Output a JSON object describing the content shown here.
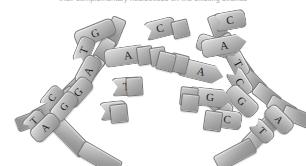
{
  "figure": {
    "caption_fragment": "their complementary nucleotides on the existing strands",
    "background_color": "#ffffff",
    "piece_fill_light": "#e2e2e2",
    "piece_fill_dark": "#8c8c8c",
    "outline_color": "#7a7a7a",
    "letter_color": "#1b1b1b"
  },
  "left_strand": {
    "label": "left-template-strand",
    "backbone_segments": 9,
    "bases": [
      {
        "letter": "G",
        "x": 74,
        "y": 24,
        "rot": -22,
        "w": 40,
        "h": 16,
        "fs": 11
      },
      {
        "letter": "T",
        "x": 70,
        "y": 42,
        "rot": -68,
        "w": 26,
        "h": 15,
        "fs": 11
      },
      {
        "letter": "A",
        "x": 72,
        "y": 62,
        "rot": -62,
        "w": 30,
        "h": 16,
        "fs": 11
      },
      {
        "letter": "G",
        "x": 62,
        "y": 83,
        "rot": -48,
        "w": 30,
        "h": 16,
        "fs": 11
      },
      {
        "letter": "C",
        "x": 39,
        "y": 90,
        "rot": -50,
        "w": 24,
        "h": 14,
        "fs": 10
      },
      {
        "letter": "G",
        "x": 48,
        "y": 98,
        "rot": -50,
        "w": 30,
        "h": 15,
        "fs": 10
      },
      {
        "letter": "T",
        "x": 22,
        "y": 113,
        "rot": -44,
        "w": 22,
        "h": 14,
        "fs": 10
      },
      {
        "letter": "A",
        "x": 29,
        "y": 119,
        "rot": -44,
        "w": 30,
        "h": 15,
        "fs": 10
      }
    ]
  },
  "right_strand": {
    "label": "right-template-strand",
    "backbone_segments": 9,
    "bases": [
      {
        "letter": "A",
        "x": 196,
        "y": 38,
        "rot": 17,
        "w": 42,
        "h": 16,
        "fs": 11
      },
      {
        "letter": "T",
        "x": 224,
        "y": 55,
        "rot": 62,
        "w": 26,
        "h": 15,
        "fs": 11
      },
      {
        "letter": "C",
        "x": 225,
        "y": 73,
        "rot": 58,
        "w": 28,
        "h": 16,
        "fs": 11
      },
      {
        "letter": "G",
        "x": 224,
        "y": 92,
        "rot": 44,
        "w": 34,
        "h": 16,
        "fs": 11
      },
      {
        "letter": "G",
        "x": 204,
        "y": 96,
        "rot": 42,
        "w": 28,
        "h": 15,
        "fs": 11
      },
      {
        "letter": "A",
        "x": 263,
        "y": 111,
        "rot": 46,
        "w": 30,
        "h": 15,
        "fs": 10
      },
      {
        "letter": "T",
        "x": 249,
        "y": 123,
        "rot": 46,
        "w": 24,
        "h": 14,
        "fs": 10
      }
    ]
  },
  "free_nucleotides": [
    {
      "letter": "C",
      "x": 144,
      "y": 19,
      "rot": -14,
      "w": 30,
      "h": 17,
      "fs": 11,
      "shape": "tail",
      "group": "centre-left"
    },
    {
      "letter": "A",
      "x": 104,
      "y": 46,
      "rot": -8,
      "w": 46,
      "h": 17,
      "fs": 11,
      "shape": "point",
      "group": "centre-left"
    },
    {
      "letter": "T",
      "x": 111,
      "y": 77,
      "rot": -4,
      "w": 28,
      "h": 17,
      "fs": 11,
      "shape": "tail",
      "group": "centre-left"
    },
    {
      "letter": "C",
      "x": 99,
      "y": 101,
      "rot": -6,
      "w": 26,
      "h": 17,
      "fs": 11,
      "shape": "tail",
      "group": "centre-left"
    },
    {
      "letter": "C",
      "x": 214,
      "y": 11,
      "rot": -10,
      "w": 30,
      "h": 17,
      "fs": 11,
      "shape": "tail",
      "group": "centre-right"
    },
    {
      "letter": "A",
      "x": 201,
      "y": 36,
      "rot": -10,
      "w": 44,
      "h": 17,
      "fs": 11,
      "shape": "point",
      "group": "centre-right"
    },
    {
      "letter": "A",
      "x": 178,
      "y": 62,
      "rot": 14,
      "w": 44,
      "h": 17,
      "fs": 11,
      "shape": "point",
      "group": "centre-right"
    },
    {
      "letter": "G",
      "x": 188,
      "y": 88,
      "rot": 6,
      "w": 42,
      "h": 17,
      "fs": 11,
      "shape": "point",
      "group": "centre-right"
    },
    {
      "letter": "C",
      "x": 212,
      "y": 110,
      "rot": 8,
      "w": 28,
      "h": 17,
      "fs": 11,
      "shape": "tail",
      "group": "centre-right"
    }
  ],
  "counts": {
    "left_strand_bases": 8,
    "right_strand_bases": 7,
    "free_nucleotides": 9
  }
}
